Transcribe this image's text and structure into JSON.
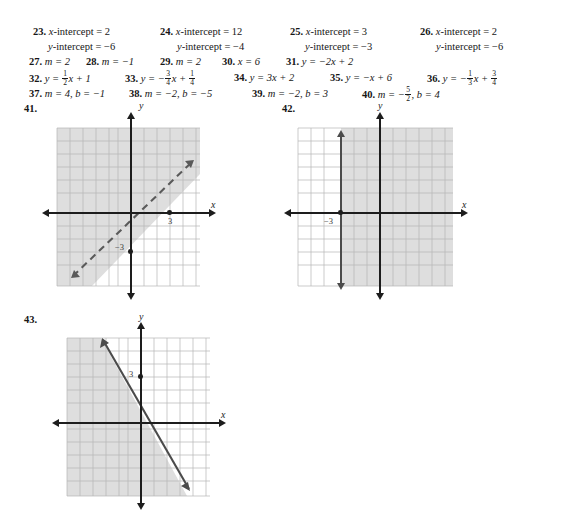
{
  "page": {
    "background": "#ffffff",
    "ink": "#161616",
    "shade_color": "#d9d9d9",
    "grid_color": "#b9b9b9"
  },
  "answers": [
    {
      "row": 0,
      "items": [
        {
          "number": "23.",
          "x": 33,
          "lines": [
            "x-intercept = 2",
            "y-intercept = −6"
          ]
        },
        {
          "number": "24.",
          "x": 160,
          "lines": [
            "x-intercept = 12",
            "y-intercept = −4"
          ]
        },
        {
          "number": "25.",
          "x": 290,
          "lines": [
            "x-intercept = 3",
            "y-intercept = −3"
          ]
        },
        {
          "number": "26.",
          "x": 420,
          "lines": [
            "x-intercept = 2",
            "y-intercept = −6"
          ]
        }
      ]
    }
  ],
  "line27": [
    {
      "number": "27.",
      "x": 29,
      "text": "m = 2"
    },
    {
      "number": "28.",
      "x": 86,
      "text": "m = −1"
    },
    {
      "number": "29.",
      "x": 160,
      "text": "m = 2"
    },
    {
      "number": "30.",
      "x": 222,
      "text": "x = 6"
    },
    {
      "number": "31.",
      "x": 286,
      "text": "y = −2x + 2"
    }
  ],
  "line32": [
    {
      "number": "32.",
      "x": 29,
      "pre": "y = ",
      "frac": {
        "n": "1",
        "d": "2"
      },
      "post": "x + 1"
    },
    {
      "number": "33.",
      "x": 125,
      "pre": "y = −",
      "frac": {
        "n": "3",
        "d": "4"
      },
      "post": "x + ",
      "frac2": {
        "n": "1",
        "d": "4"
      }
    },
    {
      "number": "34.",
      "x": 234,
      "pre": "y = 3x + 2",
      "post": ""
    },
    {
      "number": "35.",
      "x": 330,
      "pre": "y = −x + 6",
      "post": ""
    },
    {
      "number": "36.",
      "x": 427,
      "pre": "y = −",
      "frac": {
        "n": "1",
        "d": "3"
      },
      "post": "x + ",
      "frac2": {
        "n": "3",
        "d": "4"
      }
    }
  ],
  "line37": [
    {
      "number": "37.",
      "x": 29,
      "pre": "m = 4, b = −1"
    },
    {
      "number": "38.",
      "x": 129,
      "pre": "m = −2, b = −5"
    },
    {
      "number": "39.",
      "x": 252,
      "pre": "m = −2, b = 3"
    },
    {
      "number": "40.",
      "x": 362,
      "pre": "m = −",
      "frac": {
        "n": "5",
        "d": "2"
      },
      "post": ", b = 4"
    }
  ],
  "figures": [
    {
      "id": "fig-41",
      "label": "41.",
      "label_x": 24,
      "label_y": 103,
      "box": {
        "left": 57,
        "top": 128,
        "width": 143,
        "height": 158
      },
      "grid": {
        "cols": 11,
        "rows": 10
      },
      "axis_x_label": "x",
      "axis_y_label": "y",
      "axis_y_label_pos": {
        "x": 139,
        "y": 104
      },
      "axis_x_label_pos": {
        "x": 211,
        "y": 205
      },
      "tick_labels": [
        {
          "text": "3",
          "x": 163,
          "y": 216
        },
        {
          "text": "−3",
          "x": 117,
          "y": 244
        }
      ],
      "points": [
        {
          "x": 157,
          "y": 213
        },
        {
          "x": 131,
          "y": 252
        }
      ],
      "line_style": "dashed",
      "arrows_both_ends": true,
      "shading": "above-left",
      "description": "dashed boundary line slope 1 through (0,-3) and (3,0), region above the line shaded"
    },
    {
      "id": "fig-42",
      "label": "42.",
      "label_x": 282,
      "label_y": 103,
      "box": {
        "left": 298,
        "top": 128,
        "width": 155,
        "height": 158
      },
      "grid": {
        "cols": 12,
        "rows": 10
      },
      "axis_x_label": "x",
      "axis_y_label": "y",
      "axis_y_label_pos": {
        "x": 378,
        "y": 104
      },
      "axis_x_label_pos": {
        "x": 462,
        "y": 205
      },
      "tick_labels": [
        {
          "text": "−3",
          "x": 325,
          "y": 217
        }
      ],
      "points": [
        {
          "x": 341,
          "y": 213
        }
      ],
      "line_style": "solid",
      "arrows_both_ends": true,
      "shading": "right",
      "description": "solid vertical boundary line x = -3, region to the right shaded"
    },
    {
      "id": "fig-43",
      "label": "43.",
      "label_x": 24,
      "label_y": 314,
      "box": {
        "left": 67,
        "top": 338,
        "width": 143,
        "height": 158
      },
      "grid": {
        "cols": 11,
        "rows": 10
      },
      "axis_x_label": "x",
      "axis_y_label": "y",
      "axis_y_label_pos": {
        "x": 139,
        "y": 314
      },
      "axis_x_label_pos": {
        "x": 221,
        "y": 415
      },
      "tick_labels": [
        {
          "text": "3",
          "x": 129,
          "y": 373
        }
      ],
      "points": [
        {
          "x": 138,
          "y": 376
        }
      ],
      "line_style": "solid",
      "arrows_both_ends": true,
      "shading": "left",
      "description": "solid boundary line negative slope through (0,3), region to the left shaded"
    }
  ]
}
